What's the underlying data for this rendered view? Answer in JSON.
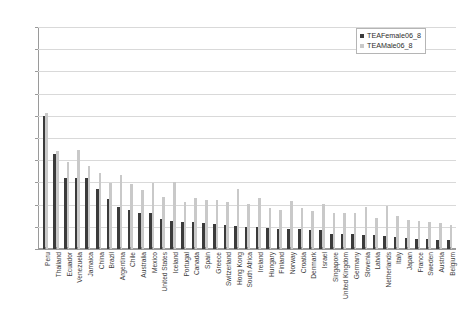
{
  "chart_data": {
    "type": "bar",
    "title": "",
    "subtitle": "",
    "xlabel": "",
    "ylabel": "",
    "ylim": [
      0,
      50
    ],
    "ytick_labels": [
      "0.00",
      "5.00",
      "10.00",
      "15.00",
      "20.00",
      "25.00",
      "30.00",
      "35.00",
      "40.00",
      "45.00",
      "50.00"
    ],
    "ytick_values": [
      0,
      5,
      10,
      15,
      20,
      25,
      30,
      35,
      40,
      45,
      50
    ],
    "grid": true,
    "legend_position": "top-right",
    "categories": [
      "Peru",
      "Thailand",
      "Ecuador",
      "Venezuela",
      "Jamaica",
      "China",
      "Brazil",
      "Argentina",
      "Chile",
      "Australia",
      "Mexico",
      "United States",
      "Iceland",
      "Portugal",
      "Canada",
      "Spain",
      "Greece",
      "Switzerland",
      "Hong Kong",
      "South Africa",
      "Ireland",
      "Hungary",
      "Finland",
      "Norway",
      "Croatia",
      "Denmark",
      "Israel",
      "Singapore",
      "United Kingdom",
      "Germany",
      "Slovenia",
      "Latvia",
      "Netherlands",
      "Italy",
      "Japan",
      "France",
      "Sweden",
      "Austria",
      "Belgium"
    ],
    "series": [
      {
        "name": "TEAFemale06_8",
        "color": "#3b3b3b",
        "values": [
          29.9,
          21.5,
          16.1,
          16.1,
          16.0,
          13.6,
          11.2,
          9.4,
          8.8,
          8.0,
          8.0,
          6.8,
          6.2,
          6.0,
          6.0,
          5.8,
          5.6,
          5.4,
          5.2,
          5.0,
          4.9,
          4.8,
          4.6,
          4.5,
          4.4,
          4.3,
          4.2,
          3.4,
          3.4,
          3.3,
          3.2,
          3.1,
          3.0,
          2.6,
          2.4,
          2.3,
          2.2,
          2.1,
          2.0
        ]
      },
      {
        "name": "TEAMale06_8",
        "color": "#c9c9c9",
        "values": [
          30.6,
          22.1,
          19.6,
          22.3,
          18.6,
          17.2,
          14.8,
          16.7,
          14.6,
          13.2,
          14.8,
          11.8,
          15.0,
          10.6,
          11.6,
          11.0,
          11.0,
          10.6,
          13.6,
          10.2,
          11.6,
          9.2,
          8.8,
          10.8,
          9.2,
          8.6,
          10.2,
          8.2,
          8.0,
          8.0,
          9.4,
          7.0,
          9.6,
          7.4,
          6.6,
          6.4,
          6.0,
          5.8,
          5.4
        ]
      }
    ]
  },
  "legend": {
    "items": [
      {
        "label": "TEAFemale06_8"
      },
      {
        "label": "TEAMale06_8"
      }
    ]
  },
  "caption": {
    "text": ""
  }
}
